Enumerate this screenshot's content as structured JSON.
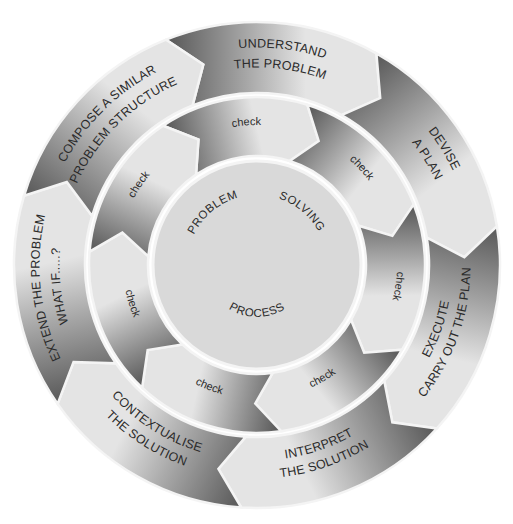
{
  "diagram": {
    "title": "PROBLEM SOLVING PROCESS",
    "center": {
      "label_top_left": "PROBLEM",
      "label_top_right": "SOLVING",
      "label_bottom": "PROCESS"
    },
    "outer_ring": {
      "start_angle_deg": -22,
      "segments": [
        {
          "id": "understand",
          "lines": [
            "UNDERSTAND",
            "THE PROBLEM"
          ]
        },
        {
          "id": "devise",
          "lines": [
            "DEVISE",
            "A PLAN"
          ]
        },
        {
          "id": "execute",
          "lines": [
            "EXECUTE",
            "CARRY OUT THE PLAN"
          ]
        },
        {
          "id": "interpret",
          "lines": [
            "INTERPRET",
            "THE SOLUTION"
          ]
        },
        {
          "id": "contextualise",
          "lines": [
            "CONTEXTUALISE",
            "THE SOLUTION"
          ]
        },
        {
          "id": "extend",
          "lines": [
            "EXTEND  THE PROBLEM",
            "WHAT IF.....?"
          ]
        },
        {
          "id": "compose",
          "lines": [
            "COMPOSE A SIMILAR",
            "PROBLEM  STRUCTURE"
          ]
        }
      ]
    },
    "middle_ring": {
      "start_angle_deg": -34,
      "segments": [
        {
          "id": "check-1",
          "label": "check"
        },
        {
          "id": "check-2",
          "label": "check"
        },
        {
          "id": "check-3",
          "label": "check"
        },
        {
          "id": "check-4",
          "label": "check"
        },
        {
          "id": "check-5",
          "label": "check"
        },
        {
          "id": "check-6",
          "label": "check"
        },
        {
          "id": "check-7",
          "label": "check"
        }
      ]
    },
    "colors": {
      "dark": "#5e5e5e",
      "mid": "#a8a8a8",
      "light": "#e4e4e4",
      "center_fill": "#d9d9d9",
      "separator": "#f4f4f4",
      "text": "#2a2a2a"
    }
  }
}
